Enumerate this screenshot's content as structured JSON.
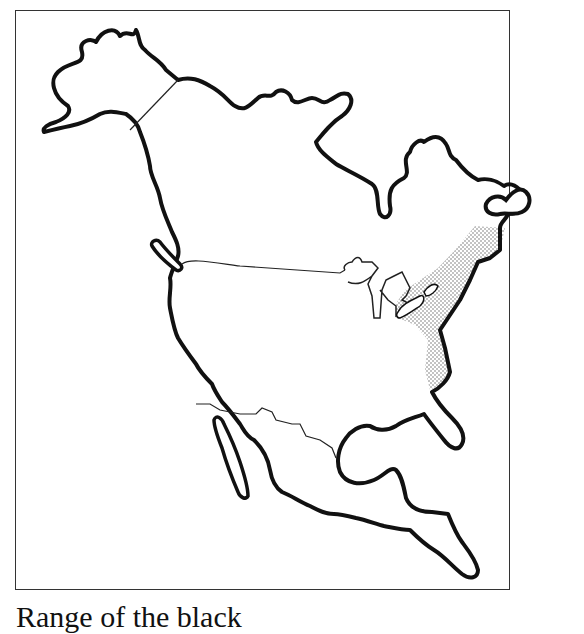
{
  "map": {
    "subject": "North America outline map",
    "regions": [
      "Alaska",
      "Canada",
      "United States",
      "Mexico",
      "Central America",
      "Great Lakes"
    ],
    "highlighted_region": "Northeastern United States and southeastern Canada (stippled range)",
    "colors": {
      "outline": "#111111",
      "border": "#333333",
      "stipple": "#777777",
      "background": "#ffffff"
    }
  },
  "caption": {
    "text": "Range of the black"
  }
}
